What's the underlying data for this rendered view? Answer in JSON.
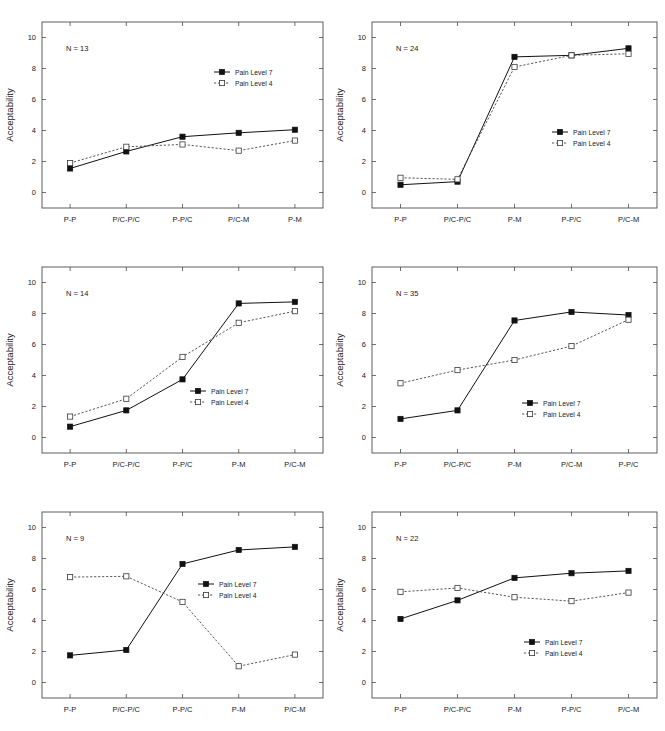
{
  "figure": {
    "title": "",
    "panel_count": 6,
    "layout": "2 columns x 3 rows",
    "shared_ylabel": "Acceptability",
    "legend_entries": [
      "Pain Level 7",
      "Pain Level 4"
    ]
  },
  "chart_data": [
    {
      "type": "line",
      "panel_id": "panel-1",
      "position": "top-left",
      "annotation": "N = 13",
      "title": "",
      "xlabel": "",
      "ylabel": "Acceptability",
      "ylim": [
        -1,
        11
      ],
      "yticks": [
        0,
        2,
        4,
        6,
        8,
        10
      ],
      "grid": false,
      "legend_position": "upper-right",
      "categories": [
        "P-P",
        "P/C-P/C",
        "P-P/C",
        "P/C-M",
        "P-M"
      ],
      "series": [
        {
          "name": "Pain Level 7",
          "style": "solid-filled-square",
          "values": [
            1.55,
            2.65,
            3.6,
            3.85,
            4.05
          ]
        },
        {
          "name": "Pain Level 4",
          "style": "dotted-open-square",
          "values": [
            1.9,
            2.95,
            3.1,
            2.7,
            3.35
          ]
        }
      ]
    },
    {
      "type": "line",
      "panel_id": "panel-2",
      "position": "top-right",
      "annotation": "N = 24",
      "title": "",
      "xlabel": "",
      "ylabel": "Acceptability",
      "ylim": [
        -1,
        11
      ],
      "yticks": [
        0,
        2,
        4,
        6,
        8,
        10
      ],
      "grid": false,
      "legend_position": "center-right",
      "categories": [
        "P-P",
        "P/C-P/C",
        "P-M",
        "P-P/C",
        "P/C-M"
      ],
      "series": [
        {
          "name": "Pain Level 7",
          "style": "solid-filled-square",
          "values": [
            0.5,
            0.7,
            8.75,
            8.85,
            9.3
          ]
        },
        {
          "name": "Pain Level 4",
          "style": "dotted-open-square",
          "values": [
            0.95,
            0.85,
            8.1,
            8.85,
            8.95
          ]
        }
      ]
    },
    {
      "type": "line",
      "panel_id": "panel-3",
      "position": "middle-left",
      "annotation": "N = 14",
      "title": "",
      "xlabel": "",
      "ylabel": "Acceptability",
      "ylim": [
        -1,
        11
      ],
      "yticks": [
        0,
        2,
        4,
        6,
        8,
        10
      ],
      "grid": false,
      "legend_position": "lower-right",
      "categories": [
        "P-P",
        "P/C-P/C",
        "P-P/C",
        "P-M",
        "P/C-M"
      ],
      "series": [
        {
          "name": "Pain Level 7",
          "style": "solid-filled-square",
          "values": [
            0.7,
            1.75,
            3.75,
            8.65,
            8.75
          ]
        },
        {
          "name": "Pain Level 4",
          "style": "dotted-open-square",
          "values": [
            1.35,
            2.5,
            5.2,
            7.4,
            8.15
          ]
        }
      ]
    },
    {
      "type": "line",
      "panel_id": "panel-4",
      "position": "middle-right",
      "annotation": "N = 35",
      "title": "",
      "xlabel": "",
      "ylabel": "Acceptability",
      "ylim": [
        -1,
        11
      ],
      "yticks": [
        0,
        2,
        4,
        6,
        8,
        10
      ],
      "grid": false,
      "legend_position": "lower-right",
      "categories": [
        "P-P",
        "P/C-P/C",
        "P-M",
        "P/C-M",
        "P-P/C"
      ],
      "series": [
        {
          "name": "Pain Level 7",
          "style": "solid-filled-square",
          "values": [
            1.2,
            1.75,
            7.55,
            8.1,
            7.9
          ]
        },
        {
          "name": "Pain Level 4",
          "style": "dotted-open-square",
          "values": [
            3.5,
            4.35,
            5.0,
            5.9,
            7.6
          ]
        }
      ]
    },
    {
      "type": "line",
      "panel_id": "panel-5",
      "position": "bottom-left",
      "annotation": "N = 9",
      "title": "",
      "xlabel": "",
      "ylabel": "Acceptability",
      "ylim": [
        -1,
        11
      ],
      "yticks": [
        0,
        2,
        4,
        6,
        8,
        10
      ],
      "grid": false,
      "legend_position": "center-right",
      "categories": [
        "P-P",
        "P/C-P/C",
        "P-P/C",
        "P-M",
        "P/C-M"
      ],
      "series": [
        {
          "name": "Pain Level 7",
          "style": "solid-filled-square",
          "values": [
            1.75,
            2.1,
            7.65,
            8.55,
            8.75
          ]
        },
        {
          "name": "Pain Level 4",
          "style": "dotted-open-square",
          "values": [
            6.8,
            6.85,
            5.2,
            1.05,
            1.8
          ]
        }
      ]
    },
    {
      "type": "line",
      "panel_id": "panel-6",
      "position": "bottom-right",
      "annotation": "N = 22",
      "title": "",
      "xlabel": "",
      "ylabel": "Acceptability",
      "ylim": [
        -1,
        11
      ],
      "yticks": [
        0,
        2,
        4,
        6,
        8,
        10
      ],
      "grid": false,
      "legend_position": "lower-right",
      "categories": [
        "P-P",
        "P/C-P/C",
        "P-M",
        "P-P/C",
        "P/C-M"
      ],
      "series": [
        {
          "name": "Pain Level 7",
          "style": "solid-filled-square",
          "values": [
            4.1,
            5.3,
            6.75,
            7.05,
            7.2
          ]
        },
        {
          "name": "Pain Level 4",
          "style": "dotted-open-square",
          "values": [
            5.85,
            6.1,
            5.5,
            5.25,
            5.8
          ]
        }
      ]
    }
  ]
}
